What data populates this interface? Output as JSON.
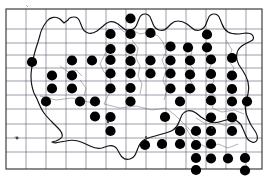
{
  "figure": {
    "kind": "distribution-map",
    "region_label": "France",
    "width": 268,
    "height": 180,
    "background_color": "#ffffff"
  },
  "grid": {
    "origin_x": 6,
    "origin_y": 9,
    "cell_size": 20,
    "columns": 13,
    "rows": 8,
    "line_color": "#5a5a6e",
    "frame_color": "#2a2a33"
  },
  "symbols": {
    "dot": {
      "name": "filled-circle",
      "radius": 5.1,
      "color": "#000000",
      "meaning": "presence record"
    }
  },
  "chart_data": {
    "type": "scatter",
    "title": "",
    "xlabel": "",
    "ylabel": "",
    "grid": true,
    "legend_position": "none",
    "xlim": [
      0,
      13
    ],
    "ylim": [
      0,
      8
    ],
    "series": [
      {
        "name": "records",
        "marker": "filled-circle",
        "color": "#000000",
        "points": [
          {
            "x": 130.5,
            "y": 18.5
          },
          {
            "x": 110.5,
            "y": 34.0
          },
          {
            "x": 130.5,
            "y": 34.0
          },
          {
            "x": 150.5,
            "y": 33.0
          },
          {
            "x": 207.0,
            "y": 34.5
          },
          {
            "x": 110.5,
            "y": 49.0
          },
          {
            "x": 130.5,
            "y": 49.0
          },
          {
            "x": 170.5,
            "y": 46.5
          },
          {
            "x": 188.0,
            "y": 47.5
          },
          {
            "x": 207.0,
            "y": 47.5
          },
          {
            "x": 32.0,
            "y": 62.0
          },
          {
            "x": 72.0,
            "y": 60.5
          },
          {
            "x": 92.0,
            "y": 60.5
          },
          {
            "x": 110.5,
            "y": 60.0
          },
          {
            "x": 130.5,
            "y": 61.0
          },
          {
            "x": 150.5,
            "y": 60.5
          },
          {
            "x": 170.5,
            "y": 60.5
          },
          {
            "x": 190.0,
            "y": 60.5
          },
          {
            "x": 211.0,
            "y": 59.5
          },
          {
            "x": 232.0,
            "y": 58.0
          },
          {
            "x": 52.0,
            "y": 75.5
          },
          {
            "x": 72.0,
            "y": 75.5
          },
          {
            "x": 110.5,
            "y": 73.5
          },
          {
            "x": 130.5,
            "y": 73.5
          },
          {
            "x": 150.5,
            "y": 73.5
          },
          {
            "x": 170.5,
            "y": 73.5
          },
          {
            "x": 190.0,
            "y": 74.5
          },
          {
            "x": 211.0,
            "y": 74.0
          },
          {
            "x": 232.0,
            "y": 75.5
          },
          {
            "x": 52.0,
            "y": 88.5
          },
          {
            "x": 72.0,
            "y": 88.5
          },
          {
            "x": 110.5,
            "y": 88.5
          },
          {
            "x": 130.5,
            "y": 88.0
          },
          {
            "x": 170.5,
            "y": 88.5
          },
          {
            "x": 190.0,
            "y": 88.5
          },
          {
            "x": 211.0,
            "y": 88.5
          },
          {
            "x": 232.0,
            "y": 89.0
          },
          {
            "x": 46.0,
            "y": 101.5
          },
          {
            "x": 80.0,
            "y": 101.5
          },
          {
            "x": 95.0,
            "y": 101.5
          },
          {
            "x": 130.5,
            "y": 101.5
          },
          {
            "x": 180.0,
            "y": 101.5
          },
          {
            "x": 211.0,
            "y": 100.5
          },
          {
            "x": 232.0,
            "y": 101.5
          },
          {
            "x": 247.0,
            "y": 101.5
          },
          {
            "x": 110.5,
            "y": 117.0
          },
          {
            "x": 165.0,
            "y": 117.0
          },
          {
            "x": 211.0,
            "y": 117.5
          },
          {
            "x": 232.0,
            "y": 117.5
          },
          {
            "x": 95.0,
            "y": 116.5
          },
          {
            "x": 110.5,
            "y": 131.0
          },
          {
            "x": 180.0,
            "y": 131.0
          },
          {
            "x": 196.0,
            "y": 131.0
          },
          {
            "x": 211.0,
            "y": 131.0
          },
          {
            "x": 232.0,
            "y": 131.0
          },
          {
            "x": 145.0,
            "y": 145.0
          },
          {
            "x": 162.0,
            "y": 144.0
          },
          {
            "x": 180.0,
            "y": 144.0
          },
          {
            "x": 196.0,
            "y": 145.0
          },
          {
            "x": 211.0,
            "y": 144.0
          },
          {
            "x": 196.0,
            "y": 158.0
          },
          {
            "x": 211.0,
            "y": 158.5
          },
          {
            "x": 228.0,
            "y": 158.5
          },
          {
            "x": 245.0,
            "y": 158.0
          },
          {
            "x": 196.0,
            "y": 170.0
          },
          {
            "x": 245.0,
            "y": 170.5
          }
        ]
      }
    ],
    "totals": {
      "marked_cells": 66
    }
  },
  "accessibility": {
    "description": "Grid-based species distribution map of France showing filled black circles in occupied grid squares, dense across the north and east, sparse in the southwest."
  }
}
